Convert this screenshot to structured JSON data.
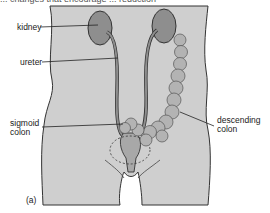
{
  "caption_fragment": "... changes that encourage ... reduction",
  "labels": {
    "kidney": "kidney",
    "ureter": "ureter",
    "sigmoid_colon_line1": "sigmoid",
    "sigmoid_colon_line2": "colon",
    "descending_colon_line1": "descending",
    "descending_colon_line2": "colon",
    "panel": "(a)"
  },
  "colors": {
    "body_fill": "#cfcfcf",
    "organ_fill": "#8e8e8e",
    "colon_fill": "#b3b3b3",
    "outline": "#333333"
  }
}
